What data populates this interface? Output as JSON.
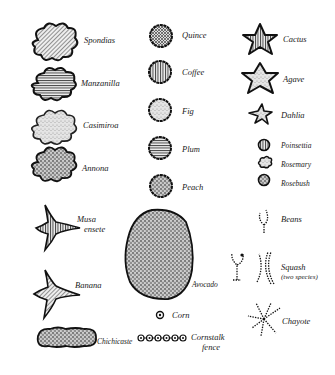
{
  "legend": {
    "column_left": [
      {
        "label": "Spondias",
        "pattern": "diagonal-hatch",
        "shape": "cloud"
      },
      {
        "label": "Manzanilla",
        "pattern": "horizontal-hatch",
        "shape": "cloud"
      },
      {
        "label": "Casimiroa",
        "pattern": "light-stipple",
        "shape": "cloud"
      },
      {
        "label": "Annona",
        "pattern": "dense-stipple",
        "shape": "cloud"
      },
      {
        "label": "Musa",
        "label2": "ensete",
        "pattern": "vertical-hatch",
        "shape": "four-point-star"
      },
      {
        "label": "Banana",
        "pattern": "diagonal-hatch",
        "shape": "four-point-star"
      },
      {
        "label": "Chichicaste",
        "pattern": "dense-stipple",
        "shape": "elongated-blob"
      }
    ],
    "column_middle": [
      {
        "label": "Quince",
        "pattern": "crosshatch",
        "shape": "round"
      },
      {
        "label": "Coffee",
        "pattern": "vertical-hatch",
        "shape": "round"
      },
      {
        "label": "Fig",
        "pattern": "light-stipple",
        "shape": "round"
      },
      {
        "label": "Plum",
        "pattern": "horizontal-hatch",
        "shape": "round"
      },
      {
        "label": "Peach",
        "pattern": "dense-stipple",
        "shape": "round"
      },
      {
        "label": "Avocado",
        "pattern": "dense-stipple",
        "shape": "large-oval"
      },
      {
        "label": "Corn",
        "shape": "dot-circle"
      },
      {
        "label": "Cornstalk",
        "label2": "fence",
        "shape": "chain-of-dots"
      }
    ],
    "column_right": [
      {
        "label": "Cactus",
        "pattern": "vertical-hatch",
        "shape": "five-point-star"
      },
      {
        "label": "Agave",
        "pattern": "light-stipple",
        "shape": "five-point-star"
      },
      {
        "label": "Dahlia",
        "pattern": "light-stipple",
        "shape": "thin-star"
      },
      {
        "label": "Poinsettia",
        "pattern": "vertical-hatch",
        "shape": "small-round"
      },
      {
        "label": "Rosemary",
        "pattern": "light-stipple",
        "shape": "small-cloud"
      },
      {
        "label": "Rosebush",
        "pattern": "dense-stipple",
        "shape": "small-round"
      },
      {
        "label": "Beans",
        "shape": "dotted-vine"
      },
      {
        "label": "Squash",
        "label2": "(two species)",
        "shape": "dotted-vine-pair"
      },
      {
        "label": "Chayote",
        "shape": "dotted-radiating-vine"
      }
    ]
  }
}
